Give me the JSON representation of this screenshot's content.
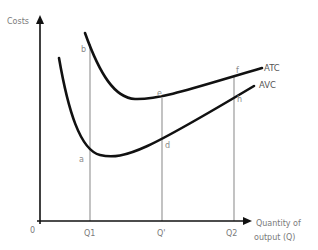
{
  "diagram": {
    "type": "economics-cost-curves",
    "y_axis_label": "Costs",
    "x_axis_label_line1": "Quantity of",
    "x_axis_label_line2": "output (Q)",
    "origin_label": "0",
    "x_ticks": [
      "Q1",
      "Q'",
      "Q2"
    ],
    "curves": [
      {
        "name": "ATC",
        "label": "ATC"
      },
      {
        "name": "AVC",
        "label": "AVC"
      }
    ],
    "points": {
      "a": "a",
      "b": "b",
      "d": "d",
      "e": "e",
      "f": "f",
      "h": "h"
    },
    "colors": {
      "axis": "#111111",
      "curve": "#111111",
      "guide": "#9a9a9a",
      "label": "#7a7a7a"
    }
  }
}
